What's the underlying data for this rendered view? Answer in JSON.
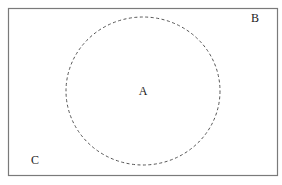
{
  "diagram": {
    "type": "venn",
    "universe": {
      "label": "B",
      "stroke": "#7a7a7a",
      "x": 8,
      "y": 8,
      "width": 269,
      "height": 167
    },
    "set_a": {
      "label": "A",
      "stroke": "#555555",
      "style": "dashed",
      "cx": 143,
      "cy": 91,
      "rx": 77,
      "ry": 74
    },
    "complement_label": "C"
  }
}
